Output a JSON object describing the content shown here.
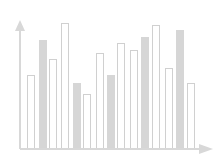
{
  "chart_data": {
    "type": "bar",
    "title": "",
    "xlabel": "",
    "ylabel": "",
    "grid": false,
    "legend": null,
    "categories": [
      "1",
      "2",
      "3",
      "4",
      "5",
      "6",
      "7",
      "8",
      "9",
      "10",
      "11",
      "12",
      "13",
      "14",
      "15"
    ],
    "values": [
      74,
      109,
      90,
      126,
      66,
      55,
      96,
      74,
      106,
      99,
      112,
      124,
      81,
      119,
      66
    ],
    "styles": [
      "outline",
      "filled",
      "outline",
      "outline",
      "filled",
      "outline",
      "outline",
      "filled",
      "outline",
      "outline",
      "filled",
      "outline",
      "outline",
      "filled",
      "outline"
    ],
    "ylim": [
      0,
      130
    ],
    "axes": {
      "x_arrow": true,
      "y_arrow": true,
      "tick_labels": false
    },
    "colors": {
      "outline_stroke": "#d0d0d0",
      "outline_fill": "#ffffff",
      "filled": "#d6d6d6",
      "axis": "#d8d8d8"
    }
  },
  "layout": {
    "baseline_y": 149,
    "axis_x": 20,
    "bar_lefts": [
      27,
      39,
      49,
      61,
      73,
      83,
      96,
      107,
      117,
      130,
      141,
      152,
      165,
      176,
      187
    ],
    "bar_width": 8
  }
}
